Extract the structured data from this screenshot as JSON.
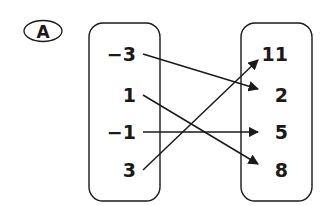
{
  "choice_label": "A",
  "domain_values": [
    "−3",
    "1",
    "−1",
    "3"
  ],
  "range_values": [
    "11",
    "2",
    "5",
    "8"
  ],
  "mappings": [
    {
      "from": "−3",
      "to": "2"
    },
    {
      "from": "1",
      "to": "8"
    },
    {
      "from": "−1",
      "to": "5"
    },
    {
      "from": "3",
      "to": "11"
    }
  ],
  "colors": {
    "ink": "#1a1a1a"
  }
}
